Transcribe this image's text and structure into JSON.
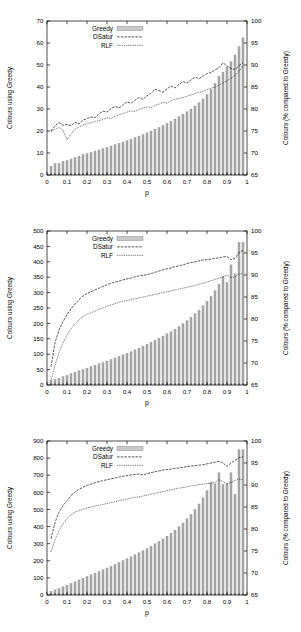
{
  "figure": {
    "panel_count": 3,
    "xlabel": "p",
    "legend": {
      "greedy": "Greedy",
      "dsatur": "DSatur",
      "rlf": "RLF"
    },
    "colors": {
      "bar_fill": "#a8a8a8",
      "bar_stroke": "#7d7d7d",
      "line": "#222222",
      "axis": "#000000",
      "background": "#ffffff"
    }
  },
  "chart_data": [
    {
      "type": "bar",
      "id": "panel-1",
      "title": "",
      "xlabel": "p",
      "ylabel": "Colours using Greedy",
      "y2label": "Colours (% compared to Greedy)",
      "xlim": [
        0,
        1
      ],
      "ylim": [
        0,
        70
      ],
      "y2lim": [
        65,
        100
      ],
      "xticks": [
        0,
        0.1,
        0.2,
        0.3,
        0.4,
        0.5,
        0.6,
        0.7,
        0.8,
        0.9,
        1
      ],
      "xticklabels": [
        "0",
        "0.1",
        "0.2",
        "0.3",
        "0.4",
        "0.5",
        "0.6",
        "0.7",
        "0.8",
        "0.9",
        "1"
      ],
      "yticks": [
        0,
        10,
        20,
        30,
        40,
        50,
        60,
        70
      ],
      "yticklabels": [
        "0",
        "10",
        "20",
        "30",
        "40",
        "50",
        "60",
        "70"
      ],
      "y2ticks": [
        65,
        70,
        75,
        80,
        85,
        90,
        95,
        100
      ],
      "y2ticklabels": [
        "65",
        "70",
        "75",
        "80",
        "85",
        "90",
        "95",
        "100"
      ],
      "grid": false,
      "legend_position": "top-left",
      "x": [
        0.02,
        0.04,
        0.06,
        0.08,
        0.1,
        0.12,
        0.14,
        0.16,
        0.18,
        0.2,
        0.22,
        0.24,
        0.26,
        0.28,
        0.3,
        0.32,
        0.34,
        0.36,
        0.38,
        0.4,
        0.42,
        0.44,
        0.46,
        0.48,
        0.5,
        0.52,
        0.54,
        0.56,
        0.58,
        0.6,
        0.62,
        0.64,
        0.66,
        0.68,
        0.7,
        0.72,
        0.74,
        0.76,
        0.78,
        0.8,
        0.82,
        0.84,
        0.86,
        0.88,
        0.9,
        0.92,
        0.94,
        0.96,
        0.98
      ],
      "series": [
        {
          "name": "Greedy",
          "kind": "bar",
          "axis": "left",
          "values": [
            4.0,
            5.2,
            5.3,
            6.3,
            6.6,
            7.3,
            8.0,
            8.6,
            9.3,
            9.8,
            10.3,
            10.9,
            11.4,
            12.0,
            12.6,
            13.2,
            13.8,
            14.4,
            15.0,
            15.6,
            16.3,
            17.0,
            17.7,
            18.4,
            19.2,
            20.0,
            20.8,
            21.6,
            22.5,
            23.4,
            24.4,
            25.4,
            26.5,
            27.6,
            28.8,
            30.0,
            31.4,
            32.9,
            34.6,
            36.6,
            38.9,
            41.6,
            44.9,
            46.8,
            49.0,
            51.5,
            54.6,
            58.4,
            62.4
          ]
        },
        {
          "name": "DSatur",
          "kind": "line",
          "axis": "right",
          "values": [
            75.0,
            76.2,
            76.9,
            76.3,
            76.5,
            76.2,
            77.0,
            76.6,
            77.5,
            77.8,
            78.2,
            78.0,
            78.9,
            79.5,
            79.3,
            80.1,
            80.6,
            80.2,
            81.0,
            81.6,
            81.3,
            82.0,
            82.6,
            82.2,
            83.0,
            83.6,
            84.5,
            84.2,
            83.8,
            84.6,
            85.2,
            84.8,
            85.6,
            86.2,
            85.9,
            86.6,
            87.2,
            86.9,
            87.5,
            88.0,
            88.3,
            88.9,
            89.4,
            90.5,
            89.8,
            89.2,
            89.0,
            89.8,
            90.5
          ]
        },
        {
          "name": "RLF",
          "kind": "line",
          "axis": "right",
          "values": [
            74.9,
            75.4,
            75.8,
            75.2,
            73.0,
            74.3,
            75.4,
            75.9,
            76.4,
            76.6,
            76.9,
            77.2,
            77.3,
            77.7,
            78.0,
            77.8,
            78.3,
            78.7,
            78.9,
            79.3,
            79.6,
            79.4,
            79.9,
            80.2,
            80.5,
            80.3,
            80.8,
            81.1,
            81.5,
            81.3,
            81.9,
            82.2,
            82.4,
            82.6,
            82.9,
            83.2,
            83.5,
            83.8,
            84.0,
            84.4,
            84.7,
            85.0,
            85.4,
            85.9,
            86.4,
            87.0,
            87.6,
            88.5,
            89.8
          ]
        }
      ]
    },
    {
      "type": "bar",
      "id": "panel-2",
      "title": "",
      "xlabel": "p",
      "ylabel": "Colours using Greedy",
      "y2label": "Colours (% compared to Greedy)",
      "xlim": [
        0,
        1
      ],
      "ylim": [
        0,
        500
      ],
      "y2lim": [
        65,
        100
      ],
      "xticks": [
        0,
        0.1,
        0.2,
        0.3,
        0.4,
        0.5,
        0.6,
        0.7,
        0.8,
        0.9,
        1
      ],
      "xticklabels": [
        "0",
        "0.1",
        "0.2",
        "0.3",
        "0.4",
        "0.5",
        "0.6",
        "0.7",
        "0.8",
        "0.9",
        "1"
      ],
      "yticks": [
        0,
        50,
        100,
        150,
        200,
        250,
        300,
        350,
        400,
        450,
        500
      ],
      "yticklabels": [
        "0",
        "50",
        "100",
        "150",
        "200",
        "250",
        "300",
        "350",
        "400",
        "450",
        "500"
      ],
      "y2ticks": [
        65,
        70,
        75,
        80,
        85,
        90,
        95,
        100
      ],
      "y2ticklabels": [
        "65",
        "70",
        "75",
        "80",
        "85",
        "90",
        "95",
        "100"
      ],
      "grid": false,
      "legend_position": "top-left",
      "x": [
        0.02,
        0.04,
        0.06,
        0.08,
        0.1,
        0.12,
        0.14,
        0.16,
        0.18,
        0.2,
        0.22,
        0.24,
        0.26,
        0.28,
        0.3,
        0.32,
        0.34,
        0.36,
        0.38,
        0.4,
        0.42,
        0.44,
        0.46,
        0.48,
        0.5,
        0.52,
        0.54,
        0.56,
        0.58,
        0.6,
        0.62,
        0.64,
        0.66,
        0.68,
        0.7,
        0.72,
        0.74,
        0.76,
        0.78,
        0.8,
        0.82,
        0.84,
        0.86,
        0.88,
        0.9,
        0.92,
        0.94,
        0.96,
        0.98
      ],
      "series": [
        {
          "name": "Greedy",
          "kind": "bar",
          "axis": "left",
          "values": [
            15,
            18,
            22,
            27,
            32,
            37,
            42,
            46,
            50,
            55,
            60,
            64,
            69,
            73,
            78,
            83,
            88,
            93,
            98,
            103,
            108,
            114,
            120,
            126,
            132,
            139,
            146,
            152,
            159,
            166,
            173,
            181,
            190,
            199,
            209,
            220,
            231,
            243,
            257,
            272,
            288,
            306,
            327,
            352,
            334,
            390,
            361,
            463,
            463
          ]
        },
        {
          "name": "DSatur",
          "kind": "line",
          "axis": "right",
          "values": [
            69.2,
            74.6,
            77.5,
            79.4,
            81.0,
            82.3,
            83.4,
            84.4,
            85.2,
            85.8,
            86.2,
            86.6,
            87.0,
            87.4,
            87.8,
            88.1,
            88.4,
            88.6,
            88.9,
            89.1,
            89.3,
            89.6,
            89.8,
            89.9,
            90.1,
            90.3,
            90.6,
            90.9,
            91.2,
            91.4,
            91.6,
            91.9,
            92.1,
            92.3,
            92.6,
            92.8,
            93.0,
            93.2,
            93.4,
            93.5,
            93.6,
            93.8,
            93.9,
            94.1,
            94.2,
            93.5,
            93.8,
            95.1,
            95.6
          ]
        },
        {
          "name": "RLF",
          "kind": "line",
          "axis": "right",
          "values": [
            66.0,
            69.5,
            72.4,
            74.6,
            76.4,
            77.8,
            78.9,
            79.8,
            80.5,
            81.1,
            81.4,
            81.8,
            82.2,
            82.5,
            82.9,
            83.2,
            83.5,
            83.8,
            84.0,
            84.2,
            84.4,
            84.6,
            84.8,
            85.0,
            85.2,
            85.4,
            85.6,
            85.8,
            86.0,
            86.2,
            86.4,
            86.6,
            86.8,
            87.0,
            87.2,
            87.4,
            87.6,
            87.9,
            88.1,
            88.4,
            88.7,
            89.0,
            89.3,
            89.6,
            90.0,
            89.4,
            89.6,
            90.2,
            90.3
          ]
        }
      ]
    },
    {
      "type": "bar",
      "id": "panel-3",
      "title": "",
      "xlabel": "p",
      "ylabel": "Colours using Greedy",
      "y2label": "Colours (% compared to Greedy)",
      "xlim": [
        0,
        1
      ],
      "ylim": [
        0,
        900
      ],
      "y2lim": [
        65,
        100
      ],
      "xticks": [
        0,
        0.1,
        0.2,
        0.3,
        0.4,
        0.5,
        0.6,
        0.7,
        0.8,
        0.9,
        1
      ],
      "xticklabels": [
        "0",
        "0.1",
        "0.2",
        "0.3",
        "0.4",
        "0.5",
        "0.6",
        "0.7",
        "0.8",
        "0.9",
        "1"
      ],
      "yticks": [
        0,
        100,
        200,
        300,
        400,
        500,
        600,
        700,
        800,
        900
      ],
      "yticklabels": [
        "0",
        "100",
        "200",
        "300",
        "400",
        "500",
        "600",
        "700",
        "800",
        "900"
      ],
      "y2ticks": [
        65,
        70,
        75,
        80,
        85,
        90,
        95,
        100
      ],
      "y2ticklabels": [
        "65",
        "70",
        "75",
        "80",
        "85",
        "90",
        "95",
        "100"
      ],
      "grid": false,
      "legend_position": "top-left",
      "x": [
        0.02,
        0.04,
        0.06,
        0.08,
        0.1,
        0.12,
        0.14,
        0.16,
        0.18,
        0.2,
        0.22,
        0.24,
        0.26,
        0.28,
        0.3,
        0.32,
        0.34,
        0.36,
        0.38,
        0.4,
        0.42,
        0.44,
        0.46,
        0.48,
        0.5,
        0.52,
        0.54,
        0.56,
        0.58,
        0.6,
        0.62,
        0.64,
        0.66,
        0.68,
        0.7,
        0.72,
        0.74,
        0.76,
        0.78,
        0.8,
        0.82,
        0.84,
        0.86,
        0.88,
        0.9,
        0.92,
        0.94,
        0.96,
        0.98
      ],
      "series": [
        {
          "name": "Greedy",
          "kind": "bar",
          "axis": "left",
          "values": [
            22,
            30,
            38,
            48,
            58,
            68,
            78,
            88,
            98,
            108,
            118,
            128,
            138,
            148,
            158,
            168,
            179,
            190,
            201,
            212,
            223,
            235,
            247,
            259,
            272,
            285,
            299,
            313,
            328,
            344,
            361,
            379,
            399,
            421,
            445,
            471,
            500,
            532,
            568,
            610,
            658,
            650,
            714,
            646,
            651,
            714,
            589,
            849,
            849
          ]
        },
        {
          "name": "DSatur",
          "kind": "line",
          "axis": "right",
          "values": [
            77.8,
            81.5,
            83.8,
            85.3,
            86.4,
            87.6,
            88.4,
            89.0,
            89.5,
            89.9,
            90.2,
            90.5,
            90.8,
            91.0,
            91.2,
            91.4,
            91.6,
            91.8,
            92.0,
            92.1,
            92.3,
            92.4,
            92.5,
            92.3,
            92.6,
            92.8,
            93.0,
            93.2,
            93.4,
            93.5,
            93.6,
            93.8,
            93.9,
            94.0,
            94.2,
            94.3,
            94.4,
            94.5,
            94.6,
            94.8,
            95.0,
            95.2,
            95.4,
            95.0,
            94.2,
            95.0,
            95.6,
            96.2,
            96.4
          ]
        },
        {
          "name": "RLF",
          "kind": "line",
          "axis": "right",
          "values": [
            74.8,
            77.6,
            79.6,
            81.2,
            82.4,
            83.2,
            83.8,
            84.2,
            84.5,
            84.8,
            85.0,
            85.2,
            85.4,
            85.6,
            85.8,
            86.0,
            86.2,
            86.4,
            86.6,
            86.8,
            87.0,
            87.2,
            87.3,
            87.5,
            87.7,
            87.9,
            88.1,
            88.3,
            88.5,
            88.7,
            88.9,
            89.1,
            89.3,
            89.4,
            89.6,
            89.8,
            89.9,
            90.1,
            90.2,
            90.3,
            90.4,
            90.6,
            91.2,
            90.8,
            90.2,
            90.6,
            91.0,
            91.4,
            91.2
          ]
        }
      ]
    }
  ]
}
